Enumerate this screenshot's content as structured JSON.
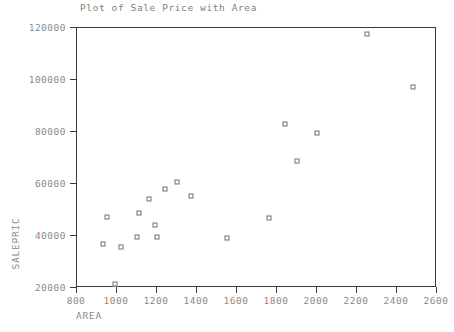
{
  "chart_data": {
    "type": "scatter",
    "title": "Plot of Sale Price with Area",
    "xlabel": "AREA",
    "ylabel": "SALEPRIC",
    "xlim": [
      800,
      2600
    ],
    "ylim": [
      20000,
      120000
    ],
    "xticks": [
      800,
      1000,
      1200,
      1400,
      1600,
      1800,
      2000,
      2200,
      2400,
      2600
    ],
    "yticks": [
      20000,
      40000,
      60000,
      80000,
      100000,
      120000
    ],
    "grid": false,
    "legend": null,
    "marker": "open-square",
    "marker_color": "#6e6e6e",
    "points": [
      {
        "x": 930,
        "y": 37000
      },
      {
        "x": 950,
        "y": 47500
      },
      {
        "x": 990,
        "y": 21500
      },
      {
        "x": 1020,
        "y": 35800
      },
      {
        "x": 1100,
        "y": 39500
      },
      {
        "x": 1110,
        "y": 48800
      },
      {
        "x": 1160,
        "y": 54300
      },
      {
        "x": 1190,
        "y": 44300
      },
      {
        "x": 1200,
        "y": 39500
      },
      {
        "x": 1240,
        "y": 58000
      },
      {
        "x": 1300,
        "y": 60700
      },
      {
        "x": 1370,
        "y": 55200
      },
      {
        "x": 1550,
        "y": 39200
      },
      {
        "x": 1760,
        "y": 47000
      },
      {
        "x": 1840,
        "y": 83000
      },
      {
        "x": 1900,
        "y": 68700
      },
      {
        "x": 2000,
        "y": 79800
      },
      {
        "x": 2250,
        "y": 117800
      },
      {
        "x": 2480,
        "y": 97400
      }
    ]
  }
}
